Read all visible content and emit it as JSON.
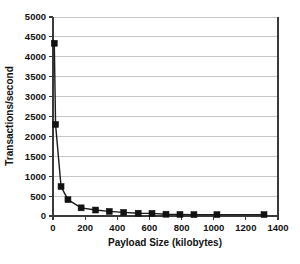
{
  "figure": {
    "background_color": "#ffffff",
    "caption_fragment": ""
  },
  "chart_data": {
    "type": "line",
    "title": "",
    "subtitle": "",
    "xlabel": "Payload Size (kilobytes)",
    "ylabel": "Transactions/second",
    "xlim": [
      0,
      1400
    ],
    "ylim": [
      0,
      5000
    ],
    "xticks": [
      0,
      200,
      400,
      600,
      800,
      1000,
      1200,
      1400
    ],
    "xtick_labels": [
      "0",
      "200",
      "400",
      "600",
      "800",
      "1000",
      "1200",
      "1400"
    ],
    "yticks": [
      0,
      500,
      1000,
      1500,
      2000,
      2500,
      3000,
      3500,
      4000,
      4500,
      5000
    ],
    "ytick_labels": [
      "0",
      "500",
      "1000",
      "1500",
      "2000",
      "2500",
      "3000",
      "3500",
      "4000",
      "4500",
      "5000"
    ],
    "grid": {
      "horizontal": true,
      "vertical": false,
      "color": "#b8b8b8"
    },
    "legend": {
      "visible": false,
      "position": "none",
      "entries": []
    },
    "marker": {
      "shape": "square",
      "size_px": 6,
      "color": "#111111"
    },
    "line_color": "#1b1b1b",
    "series": [
      {
        "name": "Transactions/second",
        "x": [
          8,
          16,
          50,
          93,
          175,
          265,
          350,
          440,
          530,
          616,
          703,
          790,
          877,
          1020,
          1313
        ],
        "y": [
          4340,
          2300,
          740,
          410,
          205,
          150,
          115,
          90,
          70,
          65,
          45,
          40,
          35,
          35,
          35
        ]
      }
    ],
    "annotations": []
  }
}
